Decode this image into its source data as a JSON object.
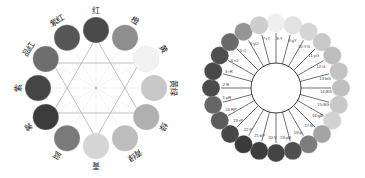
{
  "left_wheel": {
    "title": "12-hue color wheel (Chinese labels)",
    "center": [
      96,
      88
    ],
    "ring_radius": 58,
    "circle_radius": 13,
    "segments": [
      {
        "label": "红",
        "color": "#4a4a4a",
        "angle": -90
      },
      {
        "label": "橙",
        "color": "#8e8e8e",
        "angle": -60
      },
      {
        "label": "黄",
        "color": "#f2f2f2",
        "angle": -30
      },
      {
        "label": "黄绿",
        "color": "#c8c8c8",
        "angle": 0
      },
      {
        "label": "绿",
        "color": "#b0b0b0",
        "angle": 30
      },
      {
        "label": "青绿",
        "color": "#bdbdbd",
        "angle": 60
      },
      {
        "label": "青",
        "color": "#d6d6d6",
        "angle": 90
      },
      {
        "label": "蓝",
        "color": "#7a7a7a",
        "angle": 120
      },
      {
        "label": "紫",
        "color": "#3c3c3c",
        "angle": 150
      },
      {
        "label": "紫",
        "color": "#454545",
        "angle": 180
      },
      {
        "label": "品红",
        "color": "#6e6e6e",
        "angle": 210
      },
      {
        "label": "紫红",
        "color": "#565656",
        "angle": 240
      }
    ]
  },
  "right_wheel": {
    "title": "24-hue color wheel",
    "center": [
      96,
      88
    ],
    "hub_radius": 25,
    "ring_radius": 65,
    "circle_radius": 9,
    "segments": [
      {
        "label": "8:Y",
        "color": "#efefef"
      },
      {
        "label": "9:gY",
        "color": "#e3e3e3"
      },
      {
        "label": "10:YG",
        "color": "#d6d6d6"
      },
      {
        "label": "11:yG",
        "color": "#c9c9c9"
      },
      {
        "label": "12:G",
        "color": "#bdbdbd"
      },
      {
        "label": "13:bG",
        "color": "#c3c3c3"
      },
      {
        "label": "14:BG",
        "color": "#c0c0c0"
      },
      {
        "label": "15:BG",
        "color": "#c8c8c8"
      },
      {
        "label": "16:gB",
        "color": "#d2d2d2"
      },
      {
        "label": "17:B",
        "color": "#a4a4a4"
      },
      {
        "label": "18:p",
        "color": "#7c7c7c"
      },
      {
        "label": "19:pB",
        "color": "#4f4f4f"
      },
      {
        "label": "20:V",
        "color": "#434343"
      },
      {
        "label": "21:bP",
        "color": "#3e3e3e"
      },
      {
        "label": "22:P",
        "color": "#3a3a3a"
      },
      {
        "label": "23:rP",
        "color": "#474747"
      },
      {
        "label": "24:RP",
        "color": "#5c5c5c"
      },
      {
        "label": "1:pR",
        "color": "#666666"
      },
      {
        "label": "2:R",
        "color": "#4b4b4b"
      },
      {
        "label": "3:rR",
        "color": "#484848"
      },
      {
        "label": "4:rO",
        "color": "#4f4f4f"
      },
      {
        "label": "5:O",
        "color": "#6a6a6a"
      },
      {
        "label": "6:yO",
        "color": "#959595"
      },
      {
        "label": "7:rY",
        "color": "#cdcdcd"
      }
    ]
  }
}
